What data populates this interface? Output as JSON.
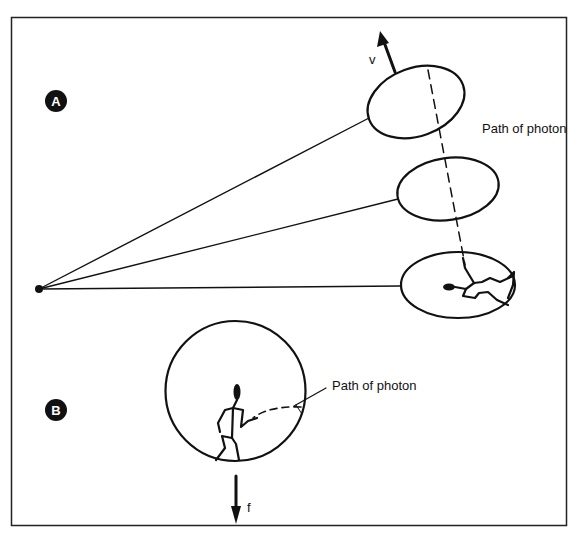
{
  "panel_a": {
    "badge": "A",
    "velocity_label": "v",
    "photon_label": "Path of photon"
  },
  "panel_b": {
    "badge": "B",
    "force_label": "f",
    "photon_label": "Path of photon"
  },
  "colors": {
    "ink": "#111111",
    "background": "#ffffff"
  }
}
